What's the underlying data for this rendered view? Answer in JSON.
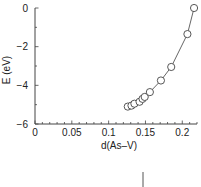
{
  "chart_data": {
    "type": "line",
    "title": "",
    "xlabel": "d(As–V)",
    "ylabel": "E (eV)",
    "xlim": [
      0,
      0.22
    ],
    "ylim": [
      -6,
      0
    ],
    "x_ticks": [
      0,
      0.05,
      0.1,
      0.15,
      0.2
    ],
    "x_tick_labels": [
      "0",
      "0.05",
      "0.1",
      "0.15",
      "0.2"
    ],
    "x_minor_step": 0.01,
    "y_ticks": [
      0,
      -2,
      -4,
      -6
    ],
    "y_tick_labels": [
      "0",
      "−2",
      "−4",
      "−6"
    ],
    "y_minor_step": 1,
    "grid": false,
    "legend": "none",
    "series": [
      {
        "name": "E vs d(As-V)",
        "marker": "open-circle",
        "x": [
          0.126,
          0.131,
          0.135,
          0.142,
          0.146,
          0.149,
          0.156,
          0.171,
          0.185,
          0.207,
          0.216
        ],
        "y": [
          -5.1,
          -5.05,
          -4.95,
          -4.85,
          -4.7,
          -4.6,
          -4.35,
          -3.75,
          -3.05,
          -1.35,
          0.0
        ]
      }
    ]
  }
}
